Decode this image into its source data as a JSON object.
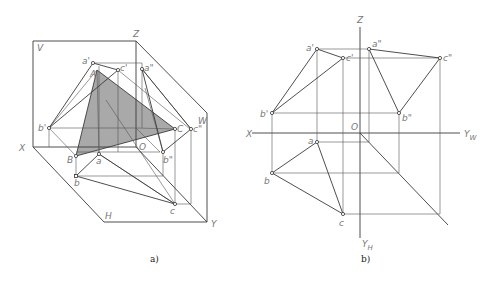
{
  "figure": {
    "left": {
      "caption": "a)",
      "description": "Axonometric view of triangle ABC with its projections on V, H, W planes",
      "planes": {
        "V": "V",
        "H": "H",
        "W": "W"
      },
      "axes": {
        "X": "X",
        "Y": "Y",
        "Z": "Z",
        "O": "O"
      },
      "space_points": {
        "A": "A",
        "B": "B",
        "C": "C"
      },
      "v_projections": {
        "a1": "a'",
        "b1": "b'",
        "c1": "c'"
      },
      "h_projections": {
        "a": "a",
        "b": "b",
        "c": "c"
      },
      "w_projections": {
        "a2": "a\"",
        "b2": "b\"",
        "c2": "c\""
      },
      "fill_color": "#a9a9a9"
    },
    "right": {
      "caption": "b)",
      "description": "Orthographic three-view projection of triangle ABC",
      "axes": {
        "X": "X",
        "Z": "Z",
        "O": "O",
        "YW": "Y",
        "YW_sub": "W",
        "YH": "Y",
        "YH_sub": "H"
      },
      "v_projections": {
        "a1": "a'",
        "b1": "b'",
        "c1": "c'"
      },
      "h_projections": {
        "a": "a",
        "b": "b",
        "c": "c"
      },
      "w_projections": {
        "a2": "a\"",
        "b2": "b\"",
        "c2": "c\""
      }
    }
  }
}
